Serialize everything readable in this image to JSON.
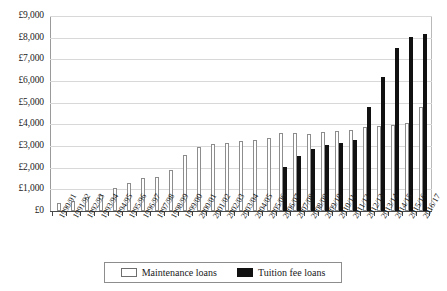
{
  "chart_data": {
    "type": "bar",
    "title": "",
    "subtitle": "",
    "xlabel": "",
    "ylabel": "",
    "ylim": [
      0,
      9000
    ],
    "ytick_step": 1000,
    "grid": true,
    "legend_position": "bottom",
    "ytick_labels": [
      "£9,000",
      "£8,000",
      "£7,000",
      "£6,000",
      "£5,000",
      "£4,000",
      "£3,000",
      "£2,000",
      "£1,000",
      "£0"
    ],
    "ytick_values": [
      9000,
      8000,
      7000,
      6000,
      5000,
      4000,
      3000,
      2000,
      1000,
      0
    ],
    "categories": [
      "1990/91",
      "1991/92",
      "1992/93",
      "1993/94",
      "1994/95",
      "1995/96",
      "1996/97",
      "1997/98",
      "1998/99",
      "1999/00",
      "2000/01",
      "2001/02",
      "2002/03",
      "2003/04",
      "2004/05",
      "2005/06",
      "2006/07",
      "2007/08",
      "2008/09",
      "2009/10",
      "2010/11",
      "2011/12",
      "2012/13",
      "2013/14",
      "2014/15",
      "2015/16",
      "2016/17"
    ],
    "series": [
      {
        "name": "Maintenance loans",
        "color": "#ffffff",
        "edge_color": "#8d8d8d",
        "values": [
          390,
          480,
          650,
          740,
          1060,
          1270,
          1510,
          1550,
          1890,
          2580,
          2940,
          3100,
          3160,
          3240,
          3300,
          3360,
          3620,
          3580,
          3560,
          3650,
          3680,
          3730,
          3880,
          3930,
          3970,
          4060,
          4800
        ]
      },
      {
        "name": "Tuition fee loans",
        "color": "#111111",
        "edge_color": "#111111",
        "values": [
          0,
          0,
          0,
          0,
          0,
          0,
          0,
          0,
          0,
          0,
          0,
          0,
          0,
          0,
          0,
          0,
          2040,
          2530,
          2870,
          3040,
          3120,
          3260,
          4810,
          6200,
          7510,
          8020,
          8160
        ]
      }
    ]
  },
  "legend": {
    "items": [
      {
        "label": "Maintenance loans",
        "swatch": "maintenance-swatch"
      },
      {
        "label": "Tuition fee loans",
        "swatch": "tuition-swatch"
      }
    ]
  }
}
